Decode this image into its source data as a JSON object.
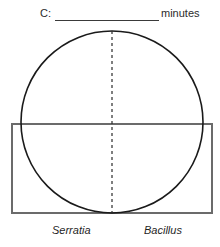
{
  "figure": {
    "header": {
      "prefix_label": "C:",
      "blank_value": "",
      "unit_label": "minutes"
    },
    "shapes": {
      "circle": {
        "name": "circle-outline",
        "center_x": 112,
        "center_y": 122,
        "radius": 91,
        "stroke_color": "#1a1a1a",
        "stroke_width": 1.6,
        "fill": "none"
      },
      "rectangle": {
        "name": "rectangle-outline",
        "x": 12,
        "y": 124,
        "width": 200,
        "height": 89,
        "stroke_color": "#6b6b6b",
        "stroke_width": 1.2,
        "fill": "none"
      },
      "dashed_axis": {
        "name": "dashed-vertical-midline",
        "x": 112,
        "y_top": 31,
        "y_bottom": 213,
        "stroke_color": "#2b2b2b",
        "stroke_width": 1.2,
        "dash_pattern": "3 3"
      }
    },
    "labels": {
      "left_organism": "Serratia",
      "right_organism": "Bacillus"
    },
    "colors": {
      "ink": "#1a1a1a",
      "rule": "#3a3a3a",
      "rect_stroke": "#6b6b6b",
      "background": "#ffffff"
    }
  }
}
